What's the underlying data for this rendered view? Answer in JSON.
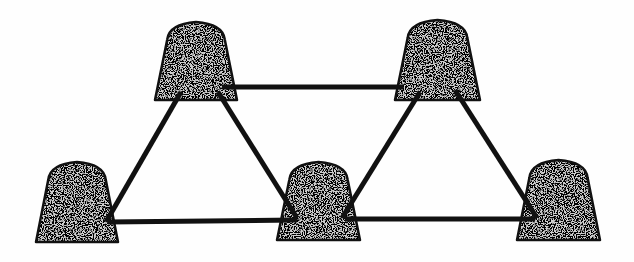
{
  "diagram": {
    "type": "network-graph",
    "colors": {
      "background": "#fefefe",
      "stroke": "#111111",
      "fill_base": "#cfcfcf",
      "speckle_dark": "#2a2a2a",
      "speckle_light": "#f2f2f2"
    },
    "edge_width": 5,
    "nodes": [
      {
        "id": "n1",
        "label": "top-left",
        "x": 155,
        "y": 22,
        "w": 82,
        "h": 78
      },
      {
        "id": "n2",
        "label": "top-right",
        "x": 395,
        "y": 20,
        "w": 85,
        "h": 80
      },
      {
        "id": "n3",
        "label": "bottom-left",
        "x": 36,
        "y": 162,
        "w": 82,
        "h": 80
      },
      {
        "id": "n4",
        "label": "bottom-middle",
        "x": 277,
        "y": 162,
        "w": 83,
        "h": 78
      },
      {
        "id": "n5",
        "label": "bottom-right",
        "x": 517,
        "y": 160,
        "w": 83,
        "h": 80
      }
    ],
    "edges": [
      {
        "from": "n1",
        "to": "n2",
        "x1": 222,
        "y1": 87,
        "x2": 403,
        "y2": 87
      },
      {
        "from": "n1",
        "to": "n3",
        "x1": 181,
        "y1": 92,
        "x2": 106,
        "y2": 222
      },
      {
        "from": "n1",
        "to": "n4",
        "x1": 218,
        "y1": 92,
        "x2": 297,
        "y2": 218
      },
      {
        "from": "n3",
        "to": "n4",
        "x1": 108,
        "y1": 222,
        "x2": 297,
        "y2": 220
      },
      {
        "from": "n2",
        "to": "n4",
        "x1": 420,
        "y1": 92,
        "x2": 342,
        "y2": 218
      },
      {
        "from": "n2",
        "to": "n5",
        "x1": 455,
        "y1": 90,
        "x2": 537,
        "y2": 218
      },
      {
        "from": "n4",
        "to": "n5",
        "x1": 345,
        "y1": 219,
        "x2": 535,
        "y2": 219
      }
    ]
  }
}
